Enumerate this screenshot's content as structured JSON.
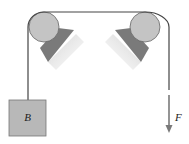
{
  "diagram": {
    "type": "pulley-system",
    "block": {
      "label": "B",
      "fill": "#b8b8b8"
    },
    "force": {
      "label": "F",
      "direction": "down"
    },
    "colors": {
      "rope": "#444444",
      "pulley_fill": "#c4c4c4",
      "pulley_stroke": "#555555",
      "bracket_dark": "#7a7a7a",
      "bracket_light": "#e0e0e0",
      "arrow": "#7a7a7a"
    }
  }
}
